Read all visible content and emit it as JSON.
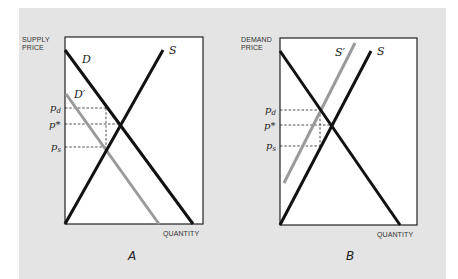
{
  "colors": {
    "background": "#ffffff",
    "panel": "#e4e4e4",
    "plot_area": "#ffffff",
    "curve": "#111111",
    "shifted_curve": "#9a9a9a",
    "dashed": "#222222"
  },
  "panels": [
    {
      "id": "A",
      "label": "A",
      "y_axis_title_line1": "SUPPLY",
      "y_axis_title_line2": "PRICE",
      "x_axis_title": "QUANTITY",
      "curves": [
        {
          "name": "D",
          "label": "D",
          "style": "black"
        },
        {
          "name": "D-prime",
          "label": "D′",
          "style": "grey"
        },
        {
          "name": "S",
          "label": "S",
          "style": "black"
        }
      ],
      "price_levels": [
        {
          "name": "pd",
          "label": "p",
          "subscript": "d"
        },
        {
          "name": "p-star",
          "label": "p*",
          "subscript": ""
        },
        {
          "name": "ps",
          "label": "p",
          "subscript": "s"
        }
      ]
    },
    {
      "id": "B",
      "label": "B",
      "y_axis_title_line1": "DEMAND",
      "y_axis_title_line2": "PRICE",
      "x_axis_title": "QUANTITY",
      "curves": [
        {
          "name": "D",
          "label": "",
          "style": "black"
        },
        {
          "name": "S-prime",
          "label": "S′",
          "style": "grey"
        },
        {
          "name": "S",
          "label": "S",
          "style": "black"
        }
      ],
      "price_levels": [
        {
          "name": "pd",
          "label": "p",
          "subscript": "d"
        },
        {
          "name": "p-star",
          "label": "p*",
          "subscript": ""
        },
        {
          "name": "ps",
          "label": "p",
          "subscript": "s"
        }
      ]
    }
  ]
}
